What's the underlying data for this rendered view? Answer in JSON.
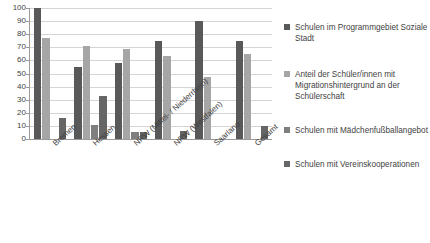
{
  "chart_data": {
    "type": "bar",
    "title": "",
    "xlabel": "",
    "ylabel": "",
    "ylim": [
      0,
      100
    ],
    "ytick_step": 10,
    "grid": true,
    "legend_position": "right",
    "categories": [
      "Bremen",
      "Hessen",
      "NRW (Mittel- / Niederrhein)",
      "NRW (Westfalen)",
      "Saarland",
      "Gesamt"
    ],
    "yticks": [
      100,
      90,
      80,
      70,
      60,
      50,
      40,
      30,
      20,
      10,
      0
    ],
    "series": [
      {
        "name": "Schulen im Programmgebiet Soziale Stadt",
        "color": "#595959",
        "values": [
          100,
          55,
          58,
          75,
          90,
          75
        ]
      },
      {
        "name": "Anteil der Schüler/innen mit Migrationshintergrund an der Schülerschaft",
        "color": "#a6a6a6",
        "values": [
          77,
          71,
          69,
          63,
          47,
          65
        ]
      },
      {
        "name": "Schulen mit Mädchenfußballangebot",
        "color": "#7f7f7f",
        "values": [
          0,
          11,
          5,
          0,
          0,
          0
        ]
      },
      {
        "name": "Schulen mit Vereinskooperationen",
        "color": "#666666",
        "values": [
          16,
          33,
          5,
          6,
          0,
          10
        ]
      }
    ]
  },
  "legend": {
    "items": [
      {
        "label": "Schulen im Programmgebiet Soziale Stadt",
        "color": "#595959"
      },
      {
        "label": "Anteil der Schüler/innen mit Migrationshintergrund an der Schülerschaft",
        "color": "#a6a6a6"
      },
      {
        "label": "Schulen mit Mädchenfußballangebot",
        "color": "#7f7f7f"
      },
      {
        "label": "Schulen mit Vereinskooperationen",
        "color": "#666666"
      }
    ]
  }
}
